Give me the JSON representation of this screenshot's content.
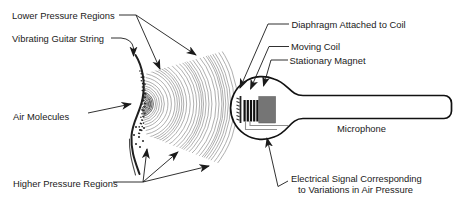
{
  "diagram": {
    "labels": {
      "lower_pressure_regions": "Lower Pressure Regions",
      "vibrating_guitar_string": "Vibrating Guitar String",
      "air_molecules": "Air Molecules",
      "higher_pressure_regions": "Higher Pressure Regions",
      "diaphragm_attached_to_coil": "Diaphragm Attached to Coil",
      "moving_coil": "Moving Coil",
      "stationary_magnet": "Stationary Magnet",
      "microphone": "Microphone",
      "electrical_signal_line1": "Electrical Signal Corresponding",
      "electrical_signal_line2": "to Variations in Air Pressure"
    },
    "colors": {
      "ink": "#1a1a1a",
      "wave": "#8d8d8d",
      "wave_dense": "#4a4a4a",
      "magnet_fill": "#757575",
      "wire": "#8f8f8f",
      "background": "#ffffff"
    }
  }
}
